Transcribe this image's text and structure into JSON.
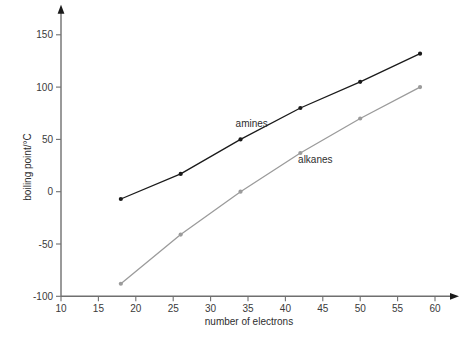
{
  "chart_data": {
    "type": "line",
    "title": "",
    "xlabel": "number of electrons",
    "ylabel": "boiling point/°C",
    "xlim": [
      10,
      60
    ],
    "ylim": [
      -100,
      150
    ],
    "xticks": [
      10,
      15,
      20,
      25,
      30,
      35,
      40,
      45,
      50,
      55,
      60
    ],
    "yticks": [
      -100,
      -50,
      0,
      50,
      100,
      150
    ],
    "xtick_labels": [
      "10",
      "15",
      "20",
      "25",
      "30",
      "35",
      "40",
      "45",
      "50",
      "55",
      "60"
    ],
    "ytick_labels": [
      "-100",
      "-50",
      "0",
      "50",
      "100",
      "150"
    ],
    "grid": false,
    "legend": "inline-annotations",
    "series": [
      {
        "name": "amines",
        "color": "#1a1a1a",
        "marker": "filled-circle",
        "x": [
          18,
          26,
          34,
          42,
          50,
          58
        ],
        "y": [
          -7,
          17,
          50,
          80,
          105,
          132
        ],
        "label_x": 35.5,
        "label_y": 62
      },
      {
        "name": "alkanes",
        "color": "#9b9b9b",
        "marker": "filled-circle",
        "x": [
          18,
          26,
          34,
          42,
          50,
          58
        ],
        "y": [
          -88,
          -41,
          0,
          37,
          70,
          100
        ],
        "label_x": 44.0,
        "label_y": 27
      }
    ],
    "annotations": [
      {
        "text": "amines",
        "x": 35.5,
        "y": 62
      },
      {
        "text": "alkanes",
        "x": 44.0,
        "y": 27
      }
    ]
  },
  "axis": {
    "x_title": "number of electrons",
    "y_title": "boiling point/°C"
  },
  "colors": {
    "axis": "#6f6f6f",
    "amines": "#1a1a1a",
    "alkanes": "#9b9b9b",
    "text": "#2e2e2e",
    "background": "#ffffff"
  }
}
